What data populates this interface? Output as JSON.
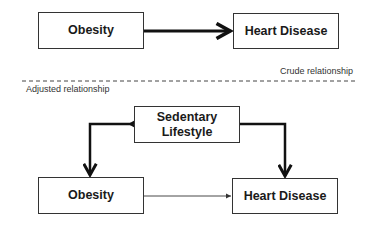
{
  "crude": {
    "exposure": "Obesity",
    "outcome": "Heart Disease",
    "label": "Crude relationship"
  },
  "adjusted": {
    "label": "Adjusted relationship",
    "confounder_line1": "Sedentary",
    "confounder_line2": "Lifestyle",
    "exposure": "Obesity",
    "outcome": "Heart Disease"
  },
  "colors": {
    "line": "#111111",
    "box_border": "#333333",
    "divider": "#444444"
  }
}
